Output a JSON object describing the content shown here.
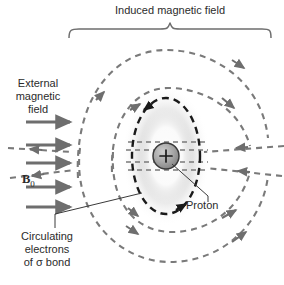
{
  "figure": {
    "domain_type": "diagram",
    "background_color": "#ffffff"
  },
  "labels": {
    "induced_field": "Induced magnetic field",
    "external_field_line1": "External",
    "external_field_line2": "magnetic",
    "external_field_line3": "field",
    "b0_symbol": "B",
    "b0_subscript": "0",
    "circulating_line1": "Circulating",
    "circulating_line2": "electrons",
    "circulating_line3": "of σ bond",
    "proton": "Proton",
    "proton_charge": "+"
  },
  "colors": {
    "field_line_gray": "#7a7a7a",
    "arrow_gray": "#6e6e6e",
    "electron_orbit_dark": "#1a1a1a",
    "proton_fill": "#9a9a9a",
    "proton_stroke": "#3a3a3a",
    "text": "#2b2b2b",
    "brace": "#6e6e6e",
    "leader_line": "#3a3a3a"
  },
  "elements": {
    "external_arrow_count": 5,
    "external_arrow_y": [
      122,
      145,
      163,
      181,
      205
    ],
    "external_arrow_x_start": 26,
    "external_arrow_x_end": 72,
    "proton_center": [
      166,
      156
    ],
    "proton_radius": 13,
    "electron_ellipse_rx": 34,
    "electron_ellipse_ry": 58,
    "brace_span_x": [
      68,
      272
    ],
    "brace_tip_x": 170,
    "induced_loop_count": 6
  }
}
